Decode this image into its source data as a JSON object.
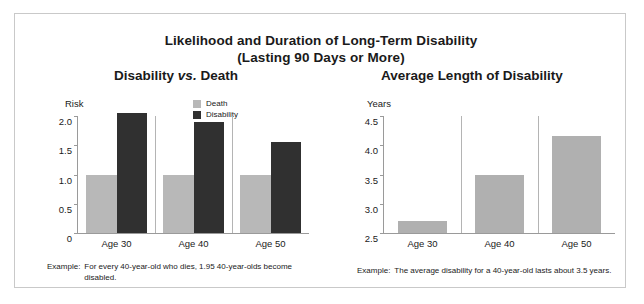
{
  "title": {
    "line1": "Likelihood and Duration of Long-Term Disability",
    "line2": "(Lasting 90 Days or More)"
  },
  "panels": {
    "left": {
      "title_part1": "Disability",
      "title_italic": "vs.",
      "title_part2": "Death",
      "axis_unit": "Risk",
      "caption_key": "Example:",
      "caption_text": "For every 40-year-old who dies, 1.95 40-year-olds become disabled."
    },
    "right": {
      "title": "Average Length of Disability",
      "axis_unit": "Years",
      "caption_key": "Example:",
      "caption_text": "The average disability for a 40-year-old lasts about 3.5 years."
    }
  },
  "legend": {
    "items": [
      {
        "label": "Death",
        "color": "#b8b8b8"
      },
      {
        "label": "Disability",
        "color": "#303030"
      }
    ]
  },
  "colors": {
    "death_bar": "#b8b8b8",
    "disability_bar": "#303030",
    "years_bar": "#b0b0b0",
    "axis": "#9a9a9a",
    "separator": "#b4b4b4",
    "frame": "#c9c9c9"
  },
  "chart_data": [
    {
      "type": "bar",
      "title": "Disability vs. Death",
      "subtitle": "Likelihood and Duration of Long-Term Disability (Lasting 90 Days or More)",
      "xlabel": "",
      "ylabel": "Risk",
      "categories": [
        "Age 30",
        "Age 40",
        "Age 50"
      ],
      "ylim": [
        0,
        2.0
      ],
      "yticks": [
        "0",
        "0.5",
        "1.0",
        "1.5",
        "2.0"
      ],
      "ytick_values": [
        0,
        0.5,
        1.0,
        1.5,
        2.0
      ],
      "grid": false,
      "legend_position": "top-center",
      "series": [
        {
          "name": "Death",
          "color": "#b8b8b8",
          "values": [
            1.0,
            1.0,
            1.0
          ]
        },
        {
          "name": "Disability",
          "color": "#303030",
          "values": [
            2.05,
            1.9,
            1.55
          ]
        }
      ],
      "annotation": "Example: For every 40-year-old who dies, 1.95 40-year-olds become disabled."
    },
    {
      "type": "bar",
      "title": "Average Length of Disability",
      "xlabel": "",
      "ylabel": "Years",
      "categories": [
        "Age 30",
        "Age 40",
        "Age 50"
      ],
      "ylim": [
        2.5,
        4.5
      ],
      "yticks": [
        "2.5",
        "3.0",
        "3.5",
        "4.0",
        "4.5"
      ],
      "ytick_values": [
        2.5,
        3.0,
        3.5,
        4.0,
        4.5
      ],
      "grid": false,
      "legend_position": "none",
      "series": [
        {
          "name": "Years",
          "color": "#b0b0b0",
          "values": [
            2.7,
            3.5,
            4.15
          ]
        }
      ],
      "annotation": "Example: The average disability for a 40-year-old lasts about 3.5 years."
    }
  ]
}
